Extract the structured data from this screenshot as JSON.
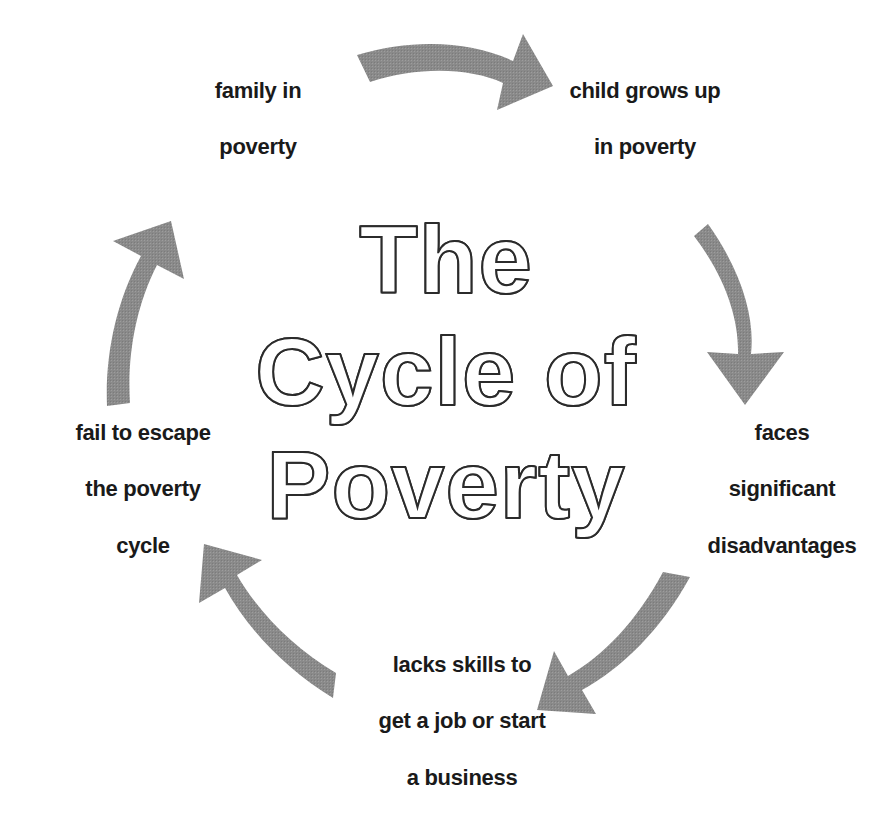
{
  "canvas": {
    "width": 893,
    "height": 825,
    "background_color": "#ffffff"
  },
  "title": {
    "full_text": "The Cycle of Poverty",
    "lines": [
      "The",
      "Cycle of",
      "Poverty"
    ],
    "style": "outlined",
    "outline_color": "#2b2b2b",
    "fill_color": "#ffffff"
  },
  "colors": {
    "arrow_gray": "#8a8a8a",
    "label_text": "#1a1a1a",
    "background": "#ffffff"
  },
  "nodes": [
    {
      "id": "family-in-poverty",
      "label": "family in\npoverty",
      "lines": [
        "family in",
        "poverty"
      ],
      "position": "top-left",
      "x": 258,
      "y": 119
    },
    {
      "id": "child-grows-up-in-poverty",
      "label": "child grows up\nin poverty",
      "lines": [
        "child grows up",
        "in poverty"
      ],
      "position": "top-right",
      "x": 645,
      "y": 119
    },
    {
      "id": "faces-significant-disadvantages",
      "label": "faces\nsignificant\ndisadvantages",
      "lines": [
        "faces",
        "significant",
        "disadvantages"
      ],
      "position": "right",
      "x": 782,
      "y": 490
    },
    {
      "id": "lacks-skills-to-get-a-job-or-start-a-business",
      "label": "lacks skills to\nget a job or start\na business",
      "lines": [
        "lacks skills to",
        "get a job or start",
        "a business"
      ],
      "position": "bottom",
      "x": 462,
      "y": 722
    },
    {
      "id": "fail-to-escape-the-poverty-cycle",
      "label": "fail to escape\nthe poverty\ncycle",
      "lines": [
        "fail to escape",
        "the poverty",
        "cycle"
      ],
      "position": "left",
      "x": 143,
      "y": 490
    }
  ],
  "arrows": [
    {
      "id": "arrow-top",
      "from": "family-in-poverty",
      "to": "child-grows-up-in-poverty",
      "direction": "right",
      "color": "#8a8a8a"
    },
    {
      "id": "arrow-right",
      "from": "child-grows-up-in-poverty",
      "to": "faces-significant-disadvantages",
      "direction": "down",
      "color": "#8a8a8a"
    },
    {
      "id": "arrow-bottom-right",
      "from": "faces-significant-disadvantages",
      "to": "lacks-skills-to-get-a-job-or-start-a-business",
      "direction": "down-left",
      "color": "#8a8a8a"
    },
    {
      "id": "arrow-bottom-left",
      "from": "lacks-skills-to-get-a-job-or-start-a-business",
      "to": "fail-to-escape-the-poverty-cycle",
      "direction": "up-left",
      "color": "#8a8a8a"
    },
    {
      "id": "arrow-left",
      "from": "fail-to-escape-the-poverty-cycle",
      "to": "family-in-poverty",
      "direction": "up",
      "color": "#8a8a8a"
    }
  ]
}
